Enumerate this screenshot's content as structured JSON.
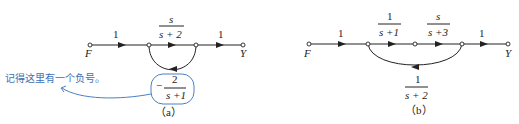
{
  "diagram_a": {
    "caption": "（a）",
    "input_label": "F",
    "output_label": "Y",
    "branches": [
      {
        "from": "F",
        "to": "n1",
        "gain": "1"
      },
      {
        "from": "n1",
        "to": "n2",
        "gain_num": "s",
        "gain_den": "s + 2"
      },
      {
        "from": "n2",
        "to": "Y",
        "gain": "1"
      },
      {
        "from": "n2",
        "to": "n1",
        "gain_sign": "−",
        "gain_num": "2",
        "gain_den": "s +1",
        "type": "feedback"
      }
    ],
    "annotation": "记得这里有一个负号。"
  },
  "diagram_b": {
    "caption": "（b）",
    "input_label": "F",
    "output_label": "Y",
    "branches": [
      {
        "from": "F",
        "to": "n1",
        "gain": "1"
      },
      {
        "from": "n1",
        "to": "n2",
        "gain_num": "1",
        "gain_den": "s +1"
      },
      {
        "from": "n2",
        "to": "n3",
        "gain_num": "s",
        "gain_den": "s +3"
      },
      {
        "from": "n3",
        "to": "Y",
        "gain": "1"
      },
      {
        "from": "n3",
        "to": "n1",
        "gain_num": "1",
        "gain_den": "s + 2",
        "type": "feedback"
      }
    ]
  }
}
